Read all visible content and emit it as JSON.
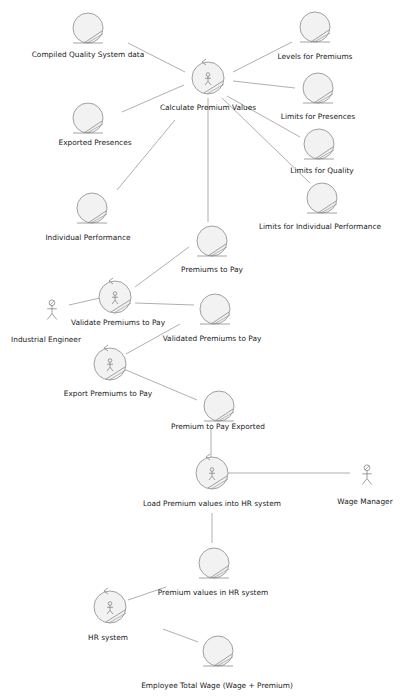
{
  "diagram": {
    "type": "UML robustness diagram",
    "colors": {
      "background": "#ffffff",
      "line": "#9a9a9a",
      "shape_fill": "#f2f2f2",
      "shape_stroke": "#8a8a8a",
      "text": "#222222"
    },
    "entities": [
      {
        "id": "compiled_quality",
        "label": "Compiled Quality System data",
        "x": 88,
        "y": 28,
        "lx": 88,
        "ly": 50
      },
      {
        "id": "levels_premiums",
        "label": "Levels for Premiums",
        "x": 315,
        "y": 27,
        "lx": 315,
        "ly": 52
      },
      {
        "id": "limits_presences",
        "label": "Limits for Presences",
        "x": 318,
        "y": 88,
        "lx": 318,
        "ly": 112
      },
      {
        "id": "exported_presences",
        "label": "Exported Presences",
        "x": 88,
        "y": 118,
        "lx": 95,
        "ly": 138
      },
      {
        "id": "limits_quality",
        "label": "Limits for Quality",
        "x": 319,
        "y": 144,
        "lx": 322,
        "ly": 166
      },
      {
        "id": "limits_individual",
        "label": "Limits for Individual Performance",
        "x": 322,
        "y": 198,
        "lx": 320,
        "ly": 222
      },
      {
        "id": "individual_performance",
        "label": "Individual Performance",
        "x": 92,
        "y": 208,
        "lx": 88,
        "ly": 233
      },
      {
        "id": "premiums_to_pay",
        "label": "Premiums to Pay",
        "x": 212,
        "y": 241,
        "lx": 212,
        "ly": 265
      },
      {
        "id": "validated_premiums",
        "label": "Validated Premiums to Pay",
        "x": 215,
        "y": 309,
        "lx": 212,
        "ly": 334
      },
      {
        "id": "premium_exported",
        "label": "Premium to Pay Exported",
        "x": 219,
        "y": 406,
        "lx": 218,
        "ly": 422
      },
      {
        "id": "premium_values_hr",
        "label": "Premium values in HR system",
        "x": 214,
        "y": 563,
        "lx": 213,
        "ly": 588
      },
      {
        "id": "employee_total_wage",
        "label": "Employee Total Wage (Wage + Premium)",
        "x": 218,
        "y": 651,
        "lx": 217,
        "ly": 681
      }
    ],
    "controls": [
      {
        "id": "calculate_premium",
        "label": "Calculate Premium Values",
        "x": 208,
        "y": 78,
        "lx": 208,
        "ly": 103
      },
      {
        "id": "validate_premiums",
        "label": "Validate Premiums to Pay",
        "x": 115,
        "y": 297,
        "lx": 118,
        "ly": 318
      },
      {
        "id": "export_premiums",
        "label": "Export Premiums to Pay",
        "x": 110,
        "y": 364,
        "lx": 108,
        "ly": 389
      },
      {
        "id": "load_premium_hr",
        "label": "Load Premium values into HR system",
        "x": 212,
        "y": 473,
        "lx": 212,
        "ly": 499
      },
      {
        "id": "hr_system",
        "label": "HR system",
        "x": 110,
        "y": 607,
        "lx": 108,
        "ly": 633
      }
    ],
    "actors": [
      {
        "id": "industrial_engineer",
        "label": "Industrial Engineer",
        "x": 52,
        "y": 310,
        "lx": 46,
        "ly": 335
      },
      {
        "id": "wage_manager",
        "label": "Wage Manager",
        "x": 367,
        "y": 475,
        "lx": 365,
        "ly": 497
      }
    ],
    "connections": [
      [
        128,
        43,
        185,
        72
      ],
      [
        122,
        112,
        184,
        85
      ],
      [
        233,
        72,
        292,
        42
      ],
      [
        233,
        81,
        295,
        88
      ],
      [
        227,
        96,
        300,
        137
      ],
      [
        222,
        98,
        310,
        183
      ],
      [
        175,
        120,
        117,
        190
      ],
      [
        208,
        98,
        208,
        222
      ],
      [
        189,
        247,
        135,
        287
      ],
      [
        135,
        303,
        194,
        305
      ],
      [
        69,
        305,
        100,
        298
      ],
      [
        180,
        324,
        126,
        354
      ],
      [
        126,
        370,
        197,
        400
      ],
      [
        211,
        428,
        211,
        458
      ],
      [
        228,
        473,
        350,
        473
      ],
      [
        212,
        513,
        212,
        543
      ],
      [
        166,
        587,
        128,
        600
      ],
      [
        163,
        629,
        198,
        642
      ]
    ]
  }
}
